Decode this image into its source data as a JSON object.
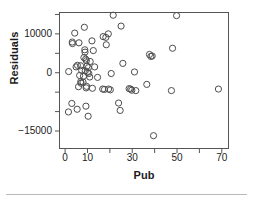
{
  "chart_data": {
    "type": "scatter",
    "title": "",
    "xlabel": "Pub",
    "ylabel": "Residuals",
    "xlim": [
      -2.5,
      73
    ],
    "ylim": [
      -19500,
      15500
    ],
    "xticks": [
      0,
      10,
      30,
      50,
      70
    ],
    "xticks_minor": [
      20,
      40,
      60
    ],
    "xtick_labels": [
      "0",
      "10",
      "30",
      "50",
      "70"
    ],
    "yticks": [
      10000,
      0,
      -15000
    ],
    "yticks_minor": [
      15000,
      5000,
      -5000,
      -10000
    ],
    "ytick_labels": [
      "10000",
      "0",
      "-15000"
    ],
    "grid": false,
    "legend": false,
    "marker": "open-circle",
    "marker_color": "#4d4d4d",
    "points": [
      {
        "x": 21.5,
        "y": 14800
      },
      {
        "x": 49.8,
        "y": 14700
      },
      {
        "x": 25.0,
        "y": 12000
      },
      {
        "x": 8.6,
        "y": 11700
      },
      {
        "x": 4.3,
        "y": 10200
      },
      {
        "x": 19.3,
        "y": 10000
      },
      {
        "x": 17.0,
        "y": 9300
      },
      {
        "x": 18.2,
        "y": 9100
      },
      {
        "x": 3.2,
        "y": 7900
      },
      {
        "x": 3.3,
        "y": 7500
      },
      {
        "x": 6.2,
        "y": 7700
      },
      {
        "x": 12.0,
        "y": 8200
      },
      {
        "x": 18.4,
        "y": 7200
      },
      {
        "x": 8.8,
        "y": 5900
      },
      {
        "x": 8.9,
        "y": 5300
      },
      {
        "x": 12.6,
        "y": 5700
      },
      {
        "x": 48.0,
        "y": 6300
      },
      {
        "x": 37.7,
        "y": 4700
      },
      {
        "x": 38.9,
        "y": 4300
      },
      {
        "x": 38.3,
        "y": 4200
      },
      {
        "x": 8.4,
        "y": 3900
      },
      {
        "x": 9.2,
        "y": 3500
      },
      {
        "x": 9.5,
        "y": 3100
      },
      {
        "x": 11.2,
        "y": 2900
      },
      {
        "x": 5.5,
        "y": 1900
      },
      {
        "x": 4.9,
        "y": 1500
      },
      {
        "x": 6.9,
        "y": 1800
      },
      {
        "x": 9.8,
        "y": 1700
      },
      {
        "x": 10.4,
        "y": 1300
      },
      {
        "x": 13.2,
        "y": 1500
      },
      {
        "x": 25.8,
        "y": 2400
      },
      {
        "x": 1.6,
        "y": 300
      },
      {
        "x": 7.4,
        "y": 600
      },
      {
        "x": 9.0,
        "y": 500
      },
      {
        "x": 10.0,
        "y": 100
      },
      {
        "x": 10.6,
        "y": -200
      },
      {
        "x": 31.0,
        "y": 200
      },
      {
        "x": 20.6,
        "y": -200
      },
      {
        "x": 6.5,
        "y": -700
      },
      {
        "x": 8.2,
        "y": -900
      },
      {
        "x": 11.0,
        "y": -1100
      },
      {
        "x": 14.5,
        "y": -1200
      },
      {
        "x": 7.0,
        "y": -2300
      },
      {
        "x": 7.1,
        "y": -2700
      },
      {
        "x": 8.0,
        "y": -2400
      },
      {
        "x": 36.5,
        "y": -3000
      },
      {
        "x": 6.0,
        "y": -3600
      },
      {
        "x": 9.4,
        "y": -3900
      },
      {
        "x": 9.6,
        "y": -3500
      },
      {
        "x": 12.2,
        "y": -4000
      },
      {
        "x": 16.8,
        "y": -4200
      },
      {
        "x": 17.6,
        "y": -4300
      },
      {
        "x": 19.4,
        "y": -4200
      },
      {
        "x": 20.2,
        "y": -4400
      },
      {
        "x": 28.6,
        "y": -4100
      },
      {
        "x": 29.3,
        "y": -4200
      },
      {
        "x": 29.8,
        "y": -4500
      },
      {
        "x": 31.6,
        "y": -4600
      },
      {
        "x": 47.5,
        "y": -4600
      },
      {
        "x": 68.5,
        "y": -4200
      },
      {
        "x": 3.0,
        "y": -7900
      },
      {
        "x": 5.4,
        "y": -9400
      },
      {
        "x": 9.3,
        "y": -8600
      },
      {
        "x": 23.9,
        "y": -7800
      },
      {
        "x": 24.6,
        "y": -9700
      },
      {
        "x": 1.5,
        "y": -10100
      },
      {
        "x": 10.3,
        "y": -11200
      },
      {
        "x": 39.5,
        "y": -16200
      }
    ]
  }
}
